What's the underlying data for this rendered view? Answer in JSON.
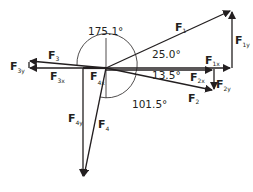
{
  "diagram": {
    "colors": {
      "stroke": "#231f20",
      "background": "#ffffff"
    },
    "origin": {
      "x": 106,
      "y": 68
    },
    "vectors": [
      {
        "id": "F1",
        "label": "F",
        "sub": "1",
        "tip": [
          232,
          10
        ]
      },
      {
        "id": "F2",
        "label": "F",
        "sub": "2",
        "tip": [
          214,
          91
        ]
      },
      {
        "id": "F3",
        "label": "F",
        "sub": "3",
        "tip": [
          28,
          61
        ]
      },
      {
        "id": "F4",
        "label": "F",
        "sub": "4",
        "tip": [
          83,
          178
        ]
      }
    ],
    "components": [
      {
        "id": "F1x",
        "label": "F",
        "sub": "1x"
      },
      {
        "id": "F1y",
        "label": "F",
        "sub": "1y"
      },
      {
        "id": "F2x",
        "label": "F",
        "sub": "2x"
      },
      {
        "id": "F2y",
        "label": "F",
        "sub": "2y"
      },
      {
        "id": "F3x",
        "label": "F",
        "sub": "3x"
      },
      {
        "id": "F3y",
        "label": "F",
        "sub": "3y"
      },
      {
        "id": "F4x",
        "label": "F",
        "sub": "4x"
      },
      {
        "id": "F4y",
        "label": "F",
        "sub": "4y"
      }
    ],
    "angles": {
      "a1": "25.0°",
      "a2": "13.5°",
      "a3": "175.1°",
      "a4": "101.5°"
    }
  }
}
